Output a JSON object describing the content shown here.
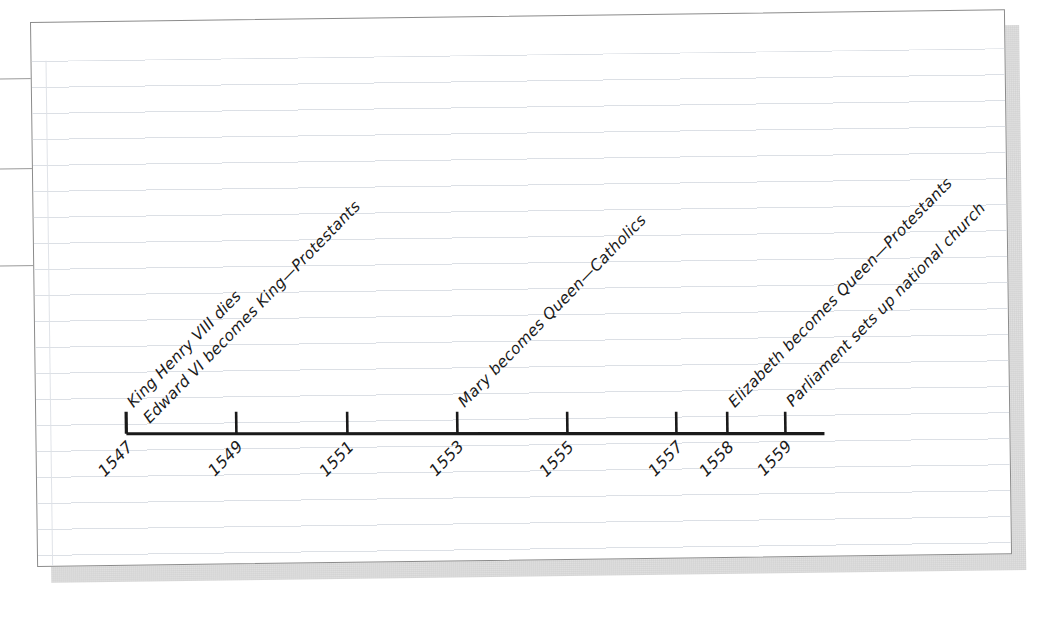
{
  "document": {
    "kind": "notebook-page-timeline",
    "tab_label": "",
    "paper_color": "#ffffff",
    "rule_color": "#dadee4",
    "ink_color": "#1a1a1a",
    "border_color": "#8b8b8b"
  },
  "chart_data": {
    "type": "timeline",
    "title": "",
    "xlabel": "",
    "ylabel": "",
    "axis_range": [
      1547,
      1559
    ],
    "grid": false,
    "legend": "none",
    "categories": [
      "1547",
      "1549",
      "1551",
      "1553",
      "1555",
      "1557",
      "1558",
      "1559"
    ],
    "values": [
      1547,
      1549,
      1551,
      1553,
      1555,
      1557,
      1558,
      1559
    ],
    "ticks": [
      {
        "year": "1547",
        "x": 120
      },
      {
        "year": "1549",
        "x": 230
      },
      {
        "year": "1551",
        "x": 341
      },
      {
        "year": "1553",
        "x": 451
      },
      {
        "year": "1555",
        "x": 561
      },
      {
        "year": "1557",
        "x": 670
      },
      {
        "year": "1558",
        "x": 721
      },
      {
        "year": "1559",
        "x": 779
      }
    ],
    "events": [
      {
        "year": "1547",
        "text": "King Henry VIII dies",
        "x": 120,
        "row": 0
      },
      {
        "year": "1547",
        "text": "Edward VI becomes King—Protestants",
        "x": 120,
        "row": 1
      },
      {
        "year": "1553",
        "text": "Mary becomes Queen—Catholics",
        "x": 451,
        "row": 0
      },
      {
        "year": "1558",
        "text": "Elizabeth becomes Queen—Protestants",
        "x": 721,
        "row": 0
      },
      {
        "year": "1559",
        "text": "Parliament sets up national church",
        "x": 779,
        "row": 0
      }
    ]
  }
}
